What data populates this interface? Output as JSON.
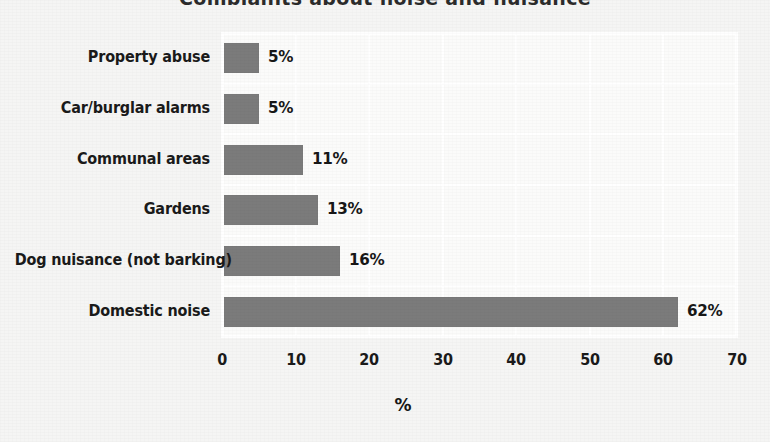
{
  "chart_data": {
    "type": "bar",
    "orientation": "horizontal",
    "title": "Complaints about noise and nuisance",
    "title_clipped": true,
    "categories": [
      "Property abuse",
      "Car/burglar alarms",
      "Communal areas",
      "Gardens",
      "Dog nuisance (not barking)",
      "Domestic noise"
    ],
    "values": [
      5,
      5,
      11,
      13,
      16,
      62
    ],
    "value_labels": [
      "5%",
      "5%",
      "11%",
      "13%",
      "16%",
      "62%"
    ],
    "xlabel": "%",
    "ylabel": "",
    "xlim": [
      0,
      70
    ],
    "xticks": [
      0,
      10,
      20,
      30,
      40,
      50,
      60,
      70
    ],
    "xtick_labels": [
      "0",
      "10",
      "20",
      "30",
      "40",
      "50",
      "60",
      "70"
    ],
    "grid": true,
    "legend": false,
    "bar_color": "#7b7b7b",
    "plot_background": "#fbfbfa",
    "page_background": "#f5f5f4",
    "gridline_color": "#ffffff",
    "text_color": "#1a1a1a"
  }
}
